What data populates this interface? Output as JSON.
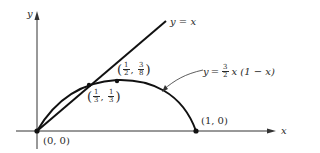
{
  "diagram": {
    "axes": {
      "x_label": "x",
      "y_label": "y"
    },
    "curves": {
      "line": {
        "label_lhs": "y",
        "label_eq": "=",
        "label_rhs": "x",
        "equation": "y = x"
      },
      "parabola": {
        "label_lhs": "y",
        "label_eq": "=",
        "coef_num": "3",
        "coef_den": "2",
        "label_rest": "x (1 − x)",
        "equation": "y = 3/2 x (1 − x)"
      }
    },
    "points": [
      {
        "name": "origin",
        "label": "(0, 0)",
        "x": 0,
        "y": 0
      },
      {
        "name": "intercept",
        "label": "(1, 0)",
        "x": 1,
        "y": 0
      },
      {
        "name": "fixed-point",
        "x_num": "1",
        "x_den": "3",
        "y_num": "1",
        "y_den": "3",
        "x": 0.3333,
        "y": 0.3333
      },
      {
        "name": "vertex",
        "x_num": "1",
        "x_den": "2",
        "y_num": "3",
        "y_den": "8",
        "x": 0.5,
        "y": 0.375
      }
    ],
    "colors": {
      "stroke": "#111111",
      "text": "#2a2a2a",
      "axis": "#333333",
      "background": "#ffffff"
    }
  }
}
